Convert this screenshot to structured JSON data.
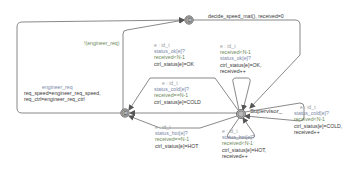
{
  "diagram": {
    "type": "timed-automaton",
    "locations": [
      {
        "id": "committed_top",
        "label": "C",
        "kind": "committed",
        "x": 189,
        "y": 20
      },
      {
        "id": "committed_left",
        "label": "C",
        "kind": "committed",
        "x": 125,
        "y": 113
      },
      {
        "id": "supervisor",
        "label": "Supervisor_",
        "kind": "initial",
        "x": 241,
        "y": 114
      }
    ],
    "edges": {
      "top_out": {
        "label": "decide_speed_mat(),  received=0"
      },
      "engineer_guard": {
        "label": "!(engineer_req)"
      },
      "engineer_req": {
        "sync": "engineer_req",
        "assign1": "req_speed=engineer_req_speed,",
        "assign2": "req_ctrl=engineer_req_ctrl"
      },
      "ok_left": {
        "select": "e : id_t",
        "sync": "status_ok[e]?",
        "guard": "received<N-1",
        "assign": "ctrl_status[e]=OK"
      },
      "ok_loop": {
        "select": "e : id_t",
        "guard": "received<N-1",
        "sync": "status_ok[e]?",
        "assign1": "ctrl_status[e]=OK,",
        "assign2": "received++"
      },
      "cold_left": {
        "select": "e : id_t",
        "sync": "status_cold[e]?",
        "guard": "received==N-1",
        "assign": "ctrl_status[e]=COLD"
      },
      "cold_loop": {
        "select": "e : id_t",
        "sync": "status_cold[e]?",
        "guard": "received<N-1",
        "assign1": "ctrl_status[e]=COLD,",
        "assign2": "received++"
      },
      "hot_left": {
        "select": "e : id_t",
        "sync": "status_hot[e]?",
        "guard": "received==N-1",
        "assign": "ctrl_status[e]=HOT"
      },
      "hot_loop": {
        "select": "e : id_t",
        "sync": "status_hot[e]?",
        "guard": "received<N-1",
        "assign1": "ctrl_status[e]=HOT,",
        "assign2": "received++"
      }
    },
    "colors": {
      "edge": "#6b6b6b",
      "location_fill": "#b9b9b9",
      "location_stroke": "#5a5a5a",
      "select": "#9aa0a6",
      "guard": "#6d8a5a",
      "sync": "#7a88a8",
      "assign": "#3a3a3a"
    }
  }
}
